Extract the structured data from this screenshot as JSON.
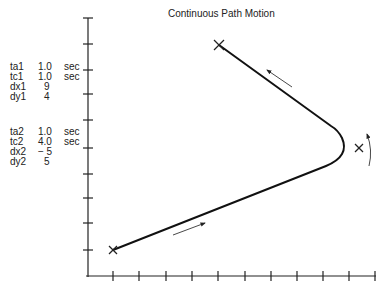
{
  "title": "Continuous Path Motion",
  "segment1": {
    "ta1": {
      "label": "ta1",
      "value": "1.0",
      "unit": "sec"
    },
    "tc1": {
      "label": "tc1",
      "value": "1.0",
      "unit": "sec"
    },
    "dx1": {
      "label": "dx1",
      "value": "9",
      "unit": ""
    },
    "dy1": {
      "label": "dy1",
      "value": "4",
      "unit": ""
    }
  },
  "segment2": {
    "ta2": {
      "label": "ta2",
      "value": "1.0",
      "unit": "sec"
    },
    "tc2": {
      "label": "tc2",
      "value": "4.0",
      "unit": "sec"
    },
    "dx2": {
      "label": "dx2",
      "value": "− 5",
      "unit": ""
    },
    "dy2": {
      "label": "dy2",
      "value": "5",
      "unit": ""
    }
  },
  "axes": {
    "x_ticks": 11,
    "y_ticks": 10
  },
  "points": {
    "start": [
      1,
      1
    ],
    "via": [
      10,
      5
    ],
    "end": [
      5,
      10
    ]
  },
  "colors": {
    "line": "#111111",
    "axis": "#222222"
  }
}
